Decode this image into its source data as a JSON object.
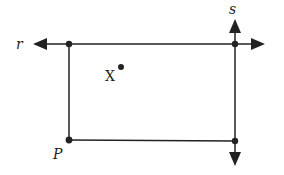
{
  "diagram": {
    "type": "geometry",
    "labels": {
      "line_r": "r",
      "line_s": "s",
      "point_p": "P",
      "point_x": "X"
    },
    "colors": {
      "stroke": "#222222",
      "background": "#ffffff"
    },
    "lines": [
      {
        "name": "r",
        "orientation": "horizontal",
        "arrows": "both",
        "from": [
          33,
          44
        ],
        "to": [
          265,
          44
        ]
      },
      {
        "name": "s",
        "orientation": "vertical",
        "arrows": "both",
        "from": [
          235,
          20
        ],
        "to": [
          235,
          166
        ]
      },
      {
        "name": "left-segment",
        "from": [
          69,
          44
        ],
        "to": [
          69,
          140
        ]
      },
      {
        "name": "bottom-segment",
        "from": [
          69,
          140
        ],
        "to": [
          235,
          141
        ]
      }
    ],
    "points": [
      {
        "name": "top-left",
        "at": [
          69,
          44
        ]
      },
      {
        "name": "top-right",
        "at": [
          235,
          44
        ]
      },
      {
        "name": "P",
        "at": [
          69,
          140
        ]
      },
      {
        "name": "bottom-right",
        "at": [
          235,
          141
        ]
      },
      {
        "name": "X",
        "at": [
          121,
          67
        ]
      }
    ]
  }
}
